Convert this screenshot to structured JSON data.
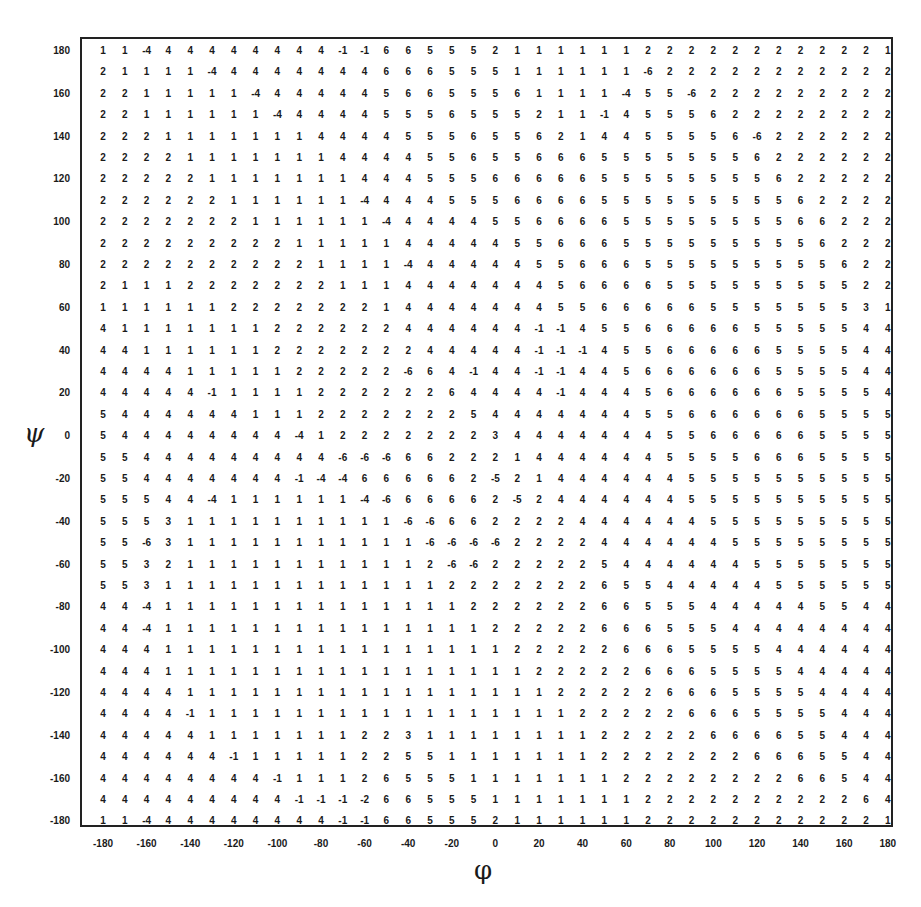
{
  "chart_data": {
    "type": "table",
    "title": "",
    "xlabel": "φ",
    "ylabel": "ψ",
    "x": [
      -180,
      -170,
      -160,
      -150,
      -140,
      -130,
      -120,
      -110,
      -100,
      -90,
      -80,
      -70,
      -60,
      -50,
      -40,
      -30,
      -20,
      -10,
      0,
      10,
      20,
      30,
      40,
      50,
      60,
      70,
      80,
      90,
      100,
      110,
      120,
      130,
      140,
      150,
      160,
      170,
      180
    ],
    "y": [
      180,
      170,
      160,
      150,
      140,
      130,
      120,
      110,
      100,
      90,
      80,
      70,
      60,
      50,
      40,
      30,
      20,
      10,
      0,
      -10,
      -20,
      -30,
      -40,
      -50,
      -60,
      -70,
      -80,
      -90,
      -100,
      -110,
      -120,
      -130,
      -140,
      -150,
      -160,
      -170,
      -180
    ],
    "xticks": [
      "-180",
      "-160",
      "-140",
      "-120",
      "-100",
      "-80",
      "-60",
      "-40",
      "-20",
      "0",
      "20",
      "40",
      "60",
      "80",
      "100",
      "120",
      "140",
      "160",
      "180"
    ],
    "yticks": [
      "180",
      "160",
      "140",
      "120",
      "100",
      "80",
      "60",
      "40",
      "20",
      "0",
      "-20",
      "-40",
      "-60",
      "-80",
      "-100",
      "-120",
      "-140",
      "-160",
      "-180"
    ],
    "xlim": [
      -180,
      180
    ],
    "ylim": [
      -180,
      180
    ],
    "grid": false,
    "legend": null,
    "rows": [
      [
        1,
        1,
        -4,
        4,
        4,
        4,
        4,
        4,
        4,
        4,
        4,
        -1,
        -1,
        6,
        6,
        5,
        5,
        5,
        2,
        1,
        1,
        1,
        1,
        1,
        1,
        2,
        2,
        2,
        2,
        2,
        2,
        2,
        2,
        2,
        2,
        2,
        1
      ],
      [
        2,
        1,
        1,
        1,
        1,
        -4,
        4,
        4,
        4,
        4,
        4,
        4,
        4,
        6,
        6,
        6,
        5,
        5,
        5,
        1,
        1,
        1,
        1,
        1,
        1,
        -6,
        2,
        2,
        2,
        2,
        2,
        2,
        2,
        2,
        2,
        2,
        2
      ],
      [
        2,
        2,
        1,
        1,
        1,
        1,
        1,
        -4,
        4,
        4,
        4,
        4,
        4,
        5,
        6,
        6,
        5,
        5,
        5,
        6,
        1,
        1,
        1,
        1,
        -4,
        5,
        5,
        -6,
        2,
        2,
        2,
        2,
        2,
        2,
        2,
        2,
        2
      ],
      [
        2,
        2,
        1,
        1,
        1,
        1,
        1,
        1,
        -4,
        4,
        4,
        4,
        4,
        5,
        5,
        5,
        6,
        5,
        5,
        5,
        2,
        1,
        1,
        -1,
        4,
        5,
        5,
        5,
        6,
        2,
        2,
        2,
        2,
        2,
        2,
        2,
        2
      ],
      [
        2,
        2,
        2,
        1,
        1,
        1,
        1,
        1,
        1,
        1,
        4,
        4,
        4,
        4,
        5,
        5,
        5,
        6,
        5,
        5,
        6,
        2,
        1,
        4,
        4,
        5,
        5,
        5,
        5,
        6,
        -6,
        2,
        2,
        2,
        2,
        2,
        2
      ],
      [
        2,
        2,
        2,
        2,
        1,
        1,
        1,
        1,
        1,
        1,
        1,
        4,
        4,
        4,
        4,
        5,
        5,
        6,
        5,
        5,
        6,
        6,
        6,
        5,
        5,
        5,
        5,
        5,
        5,
        5,
        6,
        2,
        2,
        2,
        2,
        2,
        2
      ],
      [
        2,
        2,
        2,
        2,
        2,
        1,
        1,
        1,
        1,
        1,
        1,
        1,
        4,
        4,
        4,
        5,
        5,
        5,
        6,
        6,
        6,
        6,
        6,
        5,
        5,
        5,
        5,
        5,
        5,
        5,
        5,
        6,
        2,
        2,
        2,
        2,
        2
      ],
      [
        2,
        2,
        2,
        2,
        2,
        2,
        1,
        1,
        1,
        1,
        1,
        1,
        -4,
        4,
        4,
        4,
        5,
        5,
        5,
        6,
        6,
        6,
        6,
        5,
        5,
        5,
        5,
        5,
        5,
        5,
        5,
        5,
        6,
        2,
        2,
        2,
        2
      ],
      [
        2,
        2,
        2,
        2,
        2,
        2,
        2,
        1,
        1,
        1,
        1,
        1,
        1,
        -4,
        4,
        4,
        4,
        4,
        5,
        5,
        6,
        6,
        6,
        6,
        5,
        5,
        5,
        5,
        5,
        5,
        5,
        5,
        6,
        6,
        2,
        2,
        2
      ],
      [
        2,
        2,
        2,
        2,
        2,
        2,
        2,
        2,
        2,
        1,
        1,
        1,
        1,
        1,
        4,
        4,
        4,
        4,
        4,
        5,
        5,
        6,
        6,
        6,
        5,
        5,
        5,
        5,
        5,
        5,
        5,
        5,
        5,
        6,
        2,
        2,
        2
      ],
      [
        2,
        2,
        2,
        2,
        2,
        2,
        2,
        2,
        2,
        2,
        1,
        1,
        1,
        1,
        -4,
        4,
        4,
        4,
        4,
        4,
        5,
        5,
        6,
        6,
        6,
        5,
        5,
        5,
        5,
        5,
        5,
        5,
        5,
        5,
        6,
        2,
        2
      ],
      [
        2,
        1,
        1,
        1,
        2,
        2,
        2,
        2,
        2,
        2,
        2,
        1,
        1,
        1,
        4,
        4,
        4,
        4,
        4,
        4,
        4,
        5,
        6,
        6,
        6,
        6,
        5,
        5,
        5,
        5,
        5,
        5,
        5,
        5,
        5,
        2,
        2
      ],
      [
        1,
        1,
        1,
        1,
        1,
        1,
        2,
        2,
        2,
        2,
        2,
        2,
        2,
        1,
        4,
        4,
        4,
        4,
        4,
        4,
        4,
        5,
        5,
        6,
        6,
        6,
        6,
        6,
        5,
        5,
        5,
        5,
        5,
        5,
        5,
        3,
        1
      ],
      [
        4,
        1,
        1,
        1,
        1,
        1,
        1,
        1,
        2,
        2,
        2,
        2,
        2,
        2,
        4,
        4,
        4,
        4,
        4,
        4,
        -1,
        -1,
        4,
        5,
        5,
        6,
        6,
        6,
        6,
        6,
        5,
        5,
        5,
        5,
        5,
        4,
        4
      ],
      [
        4,
        4,
        1,
        1,
        1,
        1,
        1,
        1,
        2,
        2,
        2,
        2,
        2,
        2,
        2,
        4,
        4,
        4,
        4,
        4,
        -1,
        -1,
        -1,
        4,
        5,
        5,
        6,
        6,
        6,
        6,
        6,
        5,
        5,
        5,
        5,
        4,
        4
      ],
      [
        4,
        4,
        4,
        4,
        1,
        1,
        1,
        1,
        1,
        2,
        2,
        2,
        2,
        2,
        -6,
        6,
        4,
        -1,
        4,
        4,
        -1,
        -1,
        4,
        4,
        5,
        6,
        6,
        6,
        6,
        6,
        6,
        5,
        5,
        5,
        5,
        4,
        4
      ],
      [
        4,
        4,
        4,
        4,
        4,
        -1,
        1,
        1,
        1,
        1,
        2,
        2,
        2,
        2,
        2,
        2,
        6,
        4,
        4,
        4,
        4,
        -1,
        4,
        4,
        4,
        5,
        6,
        6,
        6,
        6,
        6,
        6,
        5,
        5,
        5,
        5,
        4
      ],
      [
        5,
        4,
        4,
        4,
        4,
        4,
        4,
        1,
        1,
        1,
        2,
        2,
        2,
        2,
        2,
        2,
        2,
        5,
        4,
        4,
        4,
        4,
        4,
        4,
        4,
        5,
        5,
        6,
        6,
        6,
        6,
        6,
        6,
        5,
        5,
        5,
        5
      ],
      [
        5,
        4,
        4,
        4,
        4,
        4,
        4,
        4,
        4,
        -4,
        1,
        2,
        2,
        2,
        2,
        2,
        2,
        2,
        3,
        4,
        4,
        4,
        4,
        4,
        4,
        4,
        5,
        5,
        6,
        6,
        6,
        6,
        6,
        5,
        5,
        5,
        5
      ],
      [
        5,
        5,
        4,
        4,
        4,
        4,
        4,
        4,
        4,
        4,
        4,
        -6,
        -6,
        -6,
        6,
        6,
        2,
        2,
        2,
        1,
        4,
        4,
        4,
        4,
        4,
        4,
        5,
        5,
        5,
        5,
        6,
        6,
        6,
        5,
        5,
        5,
        5
      ],
      [
        5,
        5,
        4,
        4,
        4,
        4,
        4,
        4,
        4,
        -1,
        -4,
        -4,
        6,
        6,
        6,
        6,
        6,
        2,
        -5,
        2,
        1,
        4,
        4,
        4,
        4,
        4,
        4,
        5,
        5,
        5,
        5,
        5,
        5,
        5,
        5,
        5,
        5
      ],
      [
        5,
        5,
        5,
        4,
        4,
        -4,
        1,
        1,
        1,
        1,
        1,
        1,
        -4,
        -6,
        6,
        6,
        6,
        6,
        2,
        -5,
        2,
        4,
        4,
        4,
        4,
        4,
        4,
        5,
        5,
        5,
        5,
        5,
        5,
        5,
        5,
        5,
        5
      ],
      [
        5,
        5,
        5,
        3,
        1,
        1,
        1,
        1,
        1,
        1,
        1,
        1,
        1,
        1,
        -6,
        -6,
        6,
        6,
        2,
        2,
        2,
        2,
        4,
        4,
        4,
        4,
        4,
        4,
        5,
        5,
        5,
        5,
        5,
        5,
        5,
        5,
        5
      ],
      [
        5,
        5,
        -6,
        3,
        1,
        1,
        1,
        1,
        1,
        1,
        1,
        1,
        1,
        1,
        1,
        -6,
        -6,
        -6,
        -6,
        2,
        2,
        2,
        2,
        4,
        4,
        4,
        4,
        4,
        4,
        5,
        5,
        5,
        5,
        5,
        5,
        5,
        5
      ],
      [
        5,
        5,
        3,
        2,
        1,
        1,
        1,
        1,
        1,
        1,
        1,
        1,
        1,
        1,
        1,
        2,
        -6,
        -6,
        2,
        2,
        2,
        2,
        2,
        5,
        4,
        4,
        4,
        4,
        4,
        4,
        5,
        5,
        5,
        5,
        5,
        5,
        5
      ],
      [
        5,
        5,
        3,
        1,
        1,
        1,
        1,
        1,
        1,
        1,
        1,
        1,
        1,
        1,
        1,
        1,
        2,
        2,
        2,
        2,
        2,
        2,
        2,
        6,
        5,
        5,
        4,
        4,
        4,
        4,
        4,
        5,
        5,
        5,
        5,
        5,
        5
      ],
      [
        4,
        4,
        -4,
        1,
        1,
        1,
        1,
        1,
        1,
        1,
        1,
        1,
        1,
        1,
        1,
        1,
        1,
        2,
        2,
        2,
        2,
        2,
        2,
        6,
        6,
        5,
        5,
        5,
        4,
        4,
        4,
        4,
        4,
        5,
        5,
        4,
        4
      ],
      [
        4,
        4,
        -4,
        1,
        1,
        1,
        1,
        1,
        1,
        1,
        1,
        1,
        1,
        1,
        1,
        1,
        1,
        1,
        2,
        2,
        2,
        2,
        2,
        6,
        6,
        6,
        5,
        5,
        5,
        4,
        4,
        4,
        4,
        4,
        4,
        4,
        4
      ],
      [
        4,
        4,
        4,
        1,
        1,
        1,
        1,
        1,
        1,
        1,
        1,
        1,
        1,
        1,
        1,
        1,
        1,
        1,
        1,
        2,
        2,
        2,
        2,
        2,
        6,
        6,
        6,
        5,
        5,
        5,
        5,
        4,
        4,
        4,
        4,
        4,
        4
      ],
      [
        4,
        4,
        4,
        1,
        1,
        1,
        1,
        1,
        1,
        1,
        1,
        1,
        1,
        1,
        1,
        1,
        1,
        1,
        1,
        1,
        2,
        2,
        2,
        2,
        2,
        6,
        6,
        6,
        5,
        5,
        5,
        5,
        4,
        4,
        4,
        4,
        4
      ],
      [
        4,
        4,
        4,
        4,
        1,
        1,
        1,
        1,
        1,
        1,
        1,
        1,
        1,
        1,
        1,
        1,
        1,
        1,
        1,
        1,
        1,
        2,
        2,
        2,
        2,
        2,
        6,
        6,
        6,
        5,
        5,
        5,
        5,
        4,
        4,
        4,
        4
      ],
      [
        4,
        4,
        4,
        4,
        -1,
        1,
        1,
        1,
        1,
        1,
        1,
        1,
        1,
        1,
        1,
        1,
        1,
        1,
        1,
        1,
        1,
        1,
        2,
        2,
        2,
        2,
        2,
        6,
        6,
        6,
        5,
        5,
        5,
        5,
        4,
        4,
        4
      ],
      [
        4,
        4,
        4,
        4,
        4,
        1,
        1,
        1,
        1,
        1,
        1,
        1,
        2,
        2,
        3,
        1,
        1,
        1,
        1,
        1,
        1,
        1,
        1,
        2,
        2,
        2,
        2,
        2,
        6,
        6,
        6,
        6,
        5,
        5,
        4,
        4,
        4
      ],
      [
        4,
        4,
        4,
        4,
        4,
        4,
        -1,
        1,
        1,
        1,
        1,
        1,
        2,
        2,
        5,
        5,
        1,
        1,
        1,
        1,
        1,
        1,
        1,
        2,
        2,
        2,
        2,
        2,
        2,
        2,
        6,
        6,
        6,
        5,
        5,
        4,
        4
      ],
      [
        4,
        4,
        4,
        4,
        4,
        4,
        4,
        4,
        -1,
        1,
        1,
        1,
        2,
        6,
        5,
        5,
        5,
        1,
        1,
        1,
        1,
        1,
        1,
        1,
        2,
        2,
        2,
        2,
        2,
        2,
        2,
        2,
        6,
        6,
        5,
        4,
        4
      ],
      [
        4,
        4,
        4,
        4,
        4,
        4,
        4,
        4,
        4,
        -1,
        -1,
        -1,
        -2,
        6,
        6,
        5,
        5,
        5,
        1,
        1,
        1,
        1,
        1,
        1,
        1,
        2,
        2,
        2,
        2,
        2,
        2,
        2,
        2,
        2,
        2,
        6,
        4
      ],
      [
        1,
        1,
        -4,
        4,
        4,
        4,
        4,
        4,
        4,
        4,
        4,
        -1,
        -1,
        6,
        6,
        5,
        5,
        5,
        2,
        1,
        1,
        1,
        1,
        1,
        1,
        2,
        2,
        2,
        2,
        2,
        2,
        2,
        2,
        2,
        2,
        2,
        1
      ]
    ]
  }
}
